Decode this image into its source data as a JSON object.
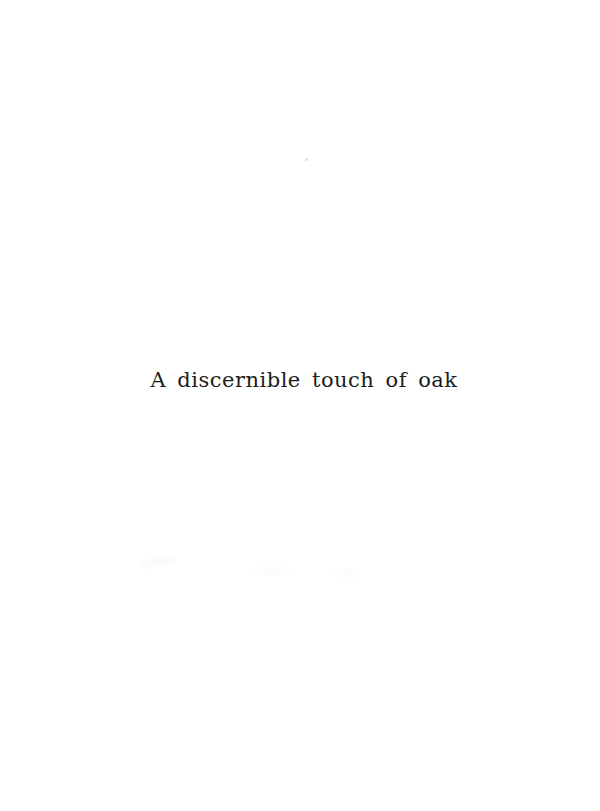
{
  "page": {
    "title": "A discernible touch of oak",
    "background_color": "#ffffff",
    "text_color": "#1d1d1b"
  }
}
